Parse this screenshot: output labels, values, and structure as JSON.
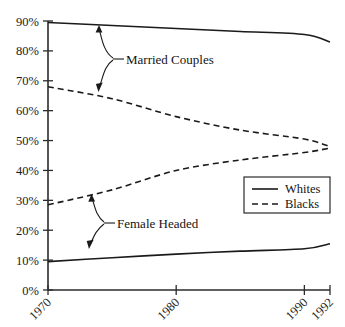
{
  "chart_data": {
    "type": "line",
    "title": "",
    "xlabel": "",
    "ylabel": "",
    "xlim": [
      1970,
      1992
    ],
    "ylim": [
      0,
      90
    ],
    "grid": false,
    "x_ticks": [
      "1970",
      "1980",
      "1990",
      "1992"
    ],
    "x_tick_values": [
      1970,
      1980,
      1990,
      1992
    ],
    "y_ticks": [
      "0%",
      "10%",
      "20%",
      "30%",
      "40%",
      "50%",
      "60%",
      "70%",
      "80%",
      "90%"
    ],
    "y_tick_values": [
      0,
      10,
      20,
      30,
      40,
      50,
      60,
      70,
      80,
      90
    ],
    "legend_position": "lower-right",
    "legend_entries": [
      {
        "label": "Whites",
        "style": "solid"
      },
      {
        "label": "Blacks",
        "style": "dashed"
      }
    ],
    "annotations": [
      {
        "text": "Married Couples",
        "points_to": [
          "Whites Married Couples",
          "Blacks Married Couples"
        ]
      },
      {
        "text": "Female Headed",
        "points_to": [
          "Blacks Female Headed",
          "Whites Female Headed"
        ]
      }
    ],
    "series": [
      {
        "name": "Whites Married Couples",
        "group": "Whites",
        "category": "Married Couples",
        "style": "solid",
        "x": [
          1970,
          1975,
          1980,
          1985,
          1990,
          1992
        ],
        "values": [
          89.5,
          88.5,
          87.5,
          86.5,
          85.5,
          83.0
        ]
      },
      {
        "name": "Blacks Married Couples",
        "group": "Blacks",
        "category": "Married Couples",
        "style": "dashed",
        "x": [
          1970,
          1975,
          1980,
          1985,
          1990,
          1992
        ],
        "values": [
          68.0,
          64.0,
          58.0,
          53.5,
          50.5,
          48.0
        ]
      },
      {
        "name": "Blacks Female Headed",
        "group": "Blacks",
        "category": "Female Headed",
        "style": "dashed",
        "x": [
          1970,
          1975,
          1980,
          1985,
          1990,
          1992
        ],
        "values": [
          28.5,
          33.5,
          40.0,
          43.5,
          46.0,
          47.5
        ]
      },
      {
        "name": "Whites Female Headed",
        "group": "Whites",
        "category": "Female Headed",
        "style": "solid",
        "x": [
          1970,
          1975,
          1980,
          1985,
          1990,
          1992
        ],
        "values": [
          9.5,
          10.8,
          12.0,
          13.0,
          13.8,
          15.5
        ]
      }
    ],
    "colors": {
      "line": "#1a1a1a",
      "axis": "#2b2b2b",
      "text": "#141414",
      "background": "#ffffff"
    }
  }
}
